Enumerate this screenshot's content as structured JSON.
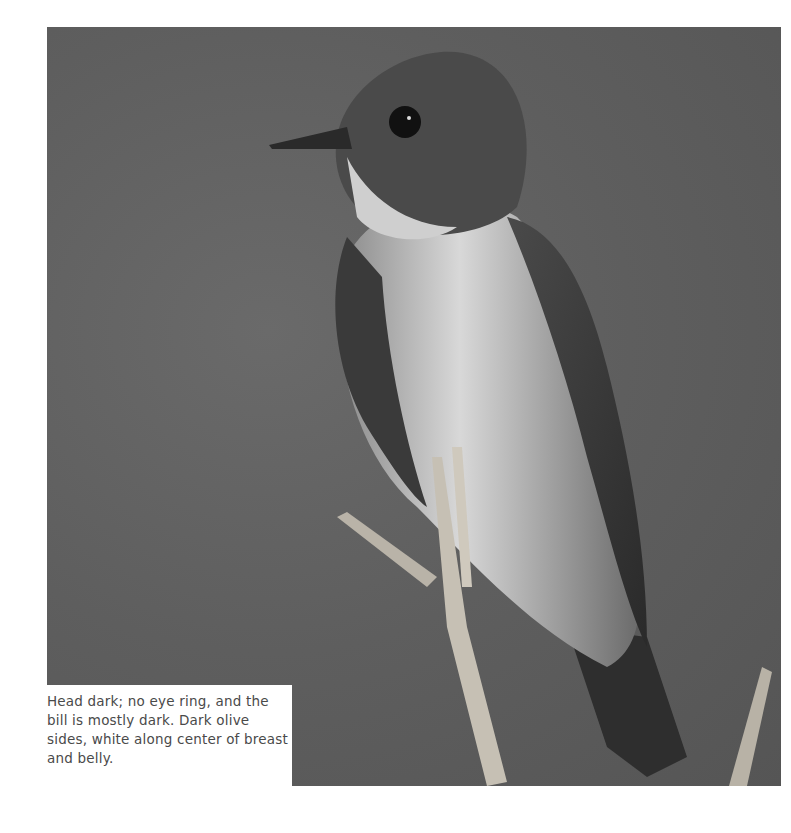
{
  "figure": {
    "caption": "Head dark; no eye ring, and the bill is mostly dark. Dark olive sides, white along center of breast and belly."
  }
}
